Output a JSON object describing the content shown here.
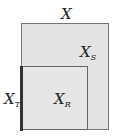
{
  "diagram": {
    "sets": {
      "X": {
        "label": "X",
        "sub": ""
      },
      "XS": {
        "label": "X",
        "sub": "S"
      },
      "XR": {
        "label": "X",
        "sub": "R"
      },
      "XT": {
        "label": "X",
        "sub": "T"
      }
    },
    "colors": {
      "fill": "#e4e4e4",
      "border": "#777777",
      "thick_edge": "#333333"
    }
  }
}
